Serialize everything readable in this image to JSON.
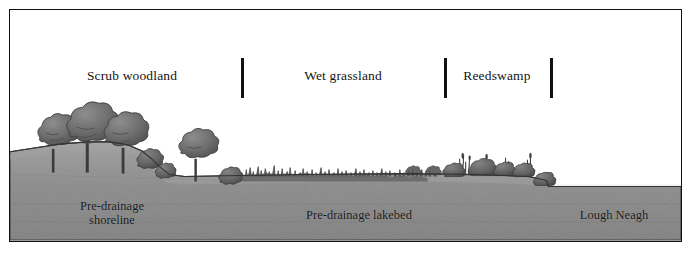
{
  "figure": {
    "frame": {
      "border_color": "#111111"
    },
    "colors": {
      "ground": "#8a8a8a",
      "ground_dark": "#7a7a7a",
      "ground_light": "#a3a3a3",
      "water": "#e4e4e4",
      "water_edge": "#c9c9c9",
      "vegetation": "#5e5e5e",
      "vegetation_dark": "#4a4a4a",
      "tree_canopy": "#6f6f6f",
      "tree_canopy_shadow": "#525252",
      "trunk": "#3b3b3b",
      "text": "#141414",
      "background": "#ffffff"
    },
    "zones": [
      {
        "id": "scrub-woodland",
        "label": "Scrub woodland",
        "center_x": 122,
        "label_y": 58
      },
      {
        "id": "wet-grassland",
        "label": "Wet grassland",
        "center_x": 333,
        "label_y": 58
      },
      {
        "id": "reedswamp",
        "label": "Reedswamp",
        "center_x": 487,
        "label_y": 58
      }
    ],
    "dividers": [
      {
        "id": "divider-scrub-grassland",
        "x": 231,
        "y": 48,
        "height": 40
      },
      {
        "id": "divider-grassland-reedswamp",
        "x": 434,
        "y": 48,
        "height": 40
      },
      {
        "id": "divider-reedswamp-water",
        "x": 540,
        "y": 48,
        "height": 40
      }
    ],
    "ground_labels": [
      {
        "id": "pre-drainage-shoreline",
        "lines": [
          "Pre-drainage",
          "shoreline"
        ],
        "center_x": 102,
        "y": 198
      },
      {
        "id": "pre-drainage-lakebed",
        "lines": [
          "Pre-drainage lakebed"
        ],
        "center_x": 349,
        "y": 207
      },
      {
        "id": "lough-neagh",
        "lines": [
          "Lough Neagh"
        ],
        "center_x": 604,
        "y": 207
      }
    ],
    "icons": {
      "tree": "tree-icon",
      "shrub": "shrub-icon",
      "reed": "reed-icon",
      "grass_tuft": "grass-tuft-icon",
      "water_surface": "water-surface-icon",
      "hillside": "hillside-icon"
    }
  }
}
